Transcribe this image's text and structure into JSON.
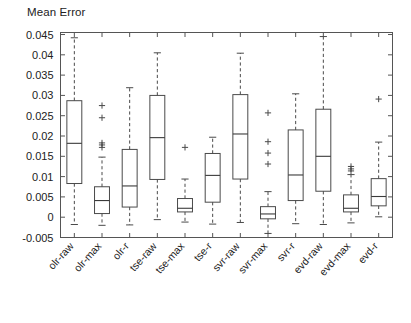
{
  "chart_data": {
    "type": "box",
    "title": "Mean Error",
    "xlabel": "",
    "ylabel": "",
    "ylim": [
      -0.005,
      0.0455
    ],
    "yticks": [
      -0.005,
      0,
      0.005,
      0.01,
      0.015,
      0.02,
      0.025,
      0.03,
      0.035,
      0.04,
      0.045
    ],
    "ytick_labels": [
      "-0.005",
      "0",
      "0.005",
      "0.01",
      "0.015",
      "0.02",
      "0.025",
      "0.03",
      "0.035",
      "0.04",
      "0.045"
    ],
    "grid": false,
    "legend": null,
    "categories": [
      "olr-raw",
      "olr-max",
      "olr-r",
      "tse-raw",
      "tse-max",
      "tse-r",
      "svr-raw",
      "svr-max",
      "svr-r",
      "evd-raw",
      "evd-max",
      "evd-r"
    ],
    "boxes": [
      {
        "label": "olr-raw",
        "whisker_low": -0.0018,
        "q1": 0.0083,
        "median": 0.0182,
        "q3": 0.0287,
        "whisker_high": 0.0442,
        "outliers": []
      },
      {
        "label": "olr-max",
        "whisker_low": -0.002,
        "q1": 0.0009,
        "median": 0.0041,
        "q3": 0.0075,
        "whisker_high": 0.0148,
        "outliers": [
          0.0275,
          0.0245,
          0.0183,
          0.0178,
          0.0172
        ]
      },
      {
        "label": "olr-r",
        "whisker_low": -0.0019,
        "q1": 0.0025,
        "median": 0.0077,
        "q3": 0.0167,
        "whisker_high": 0.0319,
        "outliers": []
      },
      {
        "label": "tse-raw",
        "whisker_low": -0.0006,
        "q1": 0.0093,
        "median": 0.0196,
        "q3": 0.03,
        "whisker_high": 0.0405,
        "outliers": []
      },
      {
        "label": "tse-max",
        "whisker_low": -0.0012,
        "q1": 0.0013,
        "median": 0.0022,
        "q3": 0.0046,
        "whisker_high": 0.0094,
        "outliers": [
          0.0172
        ]
      },
      {
        "label": "tse-r",
        "whisker_low": -0.0017,
        "q1": 0.0037,
        "median": 0.0103,
        "q3": 0.0157,
        "whisker_high": 0.0197,
        "outliers": []
      },
      {
        "label": "svr-raw",
        "whisker_low": -0.0013,
        "q1": 0.0094,
        "median": 0.0205,
        "q3": 0.0302,
        "whisker_high": 0.0404,
        "outliers": []
      },
      {
        "label": "svr-max",
        "whisker_low": -0.004,
        "q1": -0.0004,
        "median": 0.0008,
        "q3": 0.0026,
        "whisker_high": 0.0063,
        "outliers": [
          0.0257,
          0.0186,
          0.0158,
          0.0131
        ]
      },
      {
        "label": "svr-r",
        "whisker_low": -0.0016,
        "q1": 0.0041,
        "median": 0.0104,
        "q3": 0.0215,
        "whisker_high": 0.0304,
        "outliers": []
      },
      {
        "label": "evd-raw",
        "whisker_low": -0.0018,
        "q1": 0.0064,
        "median": 0.015,
        "q3": 0.0266,
        "whisker_high": 0.0445,
        "outliers": []
      },
      {
        "label": "evd-max",
        "whisker_low": -0.0014,
        "q1": 0.0013,
        "median": 0.0022,
        "q3": 0.0055,
        "whisker_high": 0.0105,
        "outliers": [
          0.0125,
          0.0119,
          0.0114
        ]
      },
      {
        "label": "evd-r",
        "whisker_low": 0.0001,
        "q1": 0.0028,
        "median": 0.0051,
        "q3": 0.0095,
        "whisker_high": 0.0185,
        "outliers": [
          0.0291
        ]
      }
    ]
  },
  "figure": {
    "background_color": "#ffffff",
    "axis_color": "#555555",
    "box_color": "#4a4a4a",
    "text_color": "#222222"
  }
}
